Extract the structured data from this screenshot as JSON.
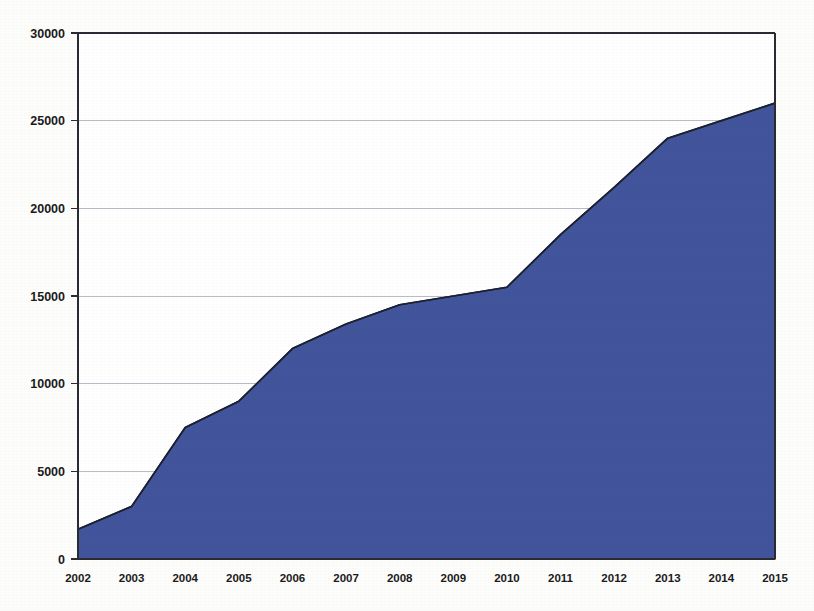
{
  "chart_data": {
    "type": "area",
    "title": "",
    "subtitle": "",
    "xlabel": "",
    "ylabel": "",
    "categories": [
      "2002",
      "2003",
      "2004",
      "2005",
      "2006",
      "2007",
      "2008",
      "2009",
      "2010",
      "2011",
      "2012",
      "2013",
      "2014",
      "2015"
    ],
    "values": [
      1700,
      3000,
      7500,
      9000,
      12000,
      13400,
      14500,
      15000,
      15500,
      18500,
      21200,
      24000,
      25000,
      26000
    ],
    "series": [
      {
        "name": "series-1",
        "values": [
          1700,
          3000,
          7500,
          9000,
          12000,
          13400,
          14500,
          15000,
          15500,
          18500,
          21200,
          24000,
          25000,
          26000
        ],
        "color": "#42559C"
      }
    ],
    "ylim": [
      0,
      30000
    ],
    "xlim": [
      "2002",
      "2015"
    ],
    "yticks": [
      0,
      5000,
      10000,
      15000,
      20000,
      25000,
      30000
    ],
    "ytick_labels": [
      "0",
      "5000",
      "10000",
      "15000",
      "20000",
      "25000",
      "30000"
    ],
    "xtick_labels": [
      "2002",
      "2003",
      "2004",
      "2005",
      "2006",
      "2007",
      "2008",
      "2009",
      "2010",
      "2011",
      "2012",
      "2013",
      "2014",
      "2015"
    ],
    "grid": true,
    "grid_axis": "y",
    "legend": false,
    "legend_position": "none",
    "annotations": []
  },
  "style": {
    "area_fill": "#42559C",
    "area_stroke": "#1d2230",
    "grid_color": "#b9bcc6",
    "axis_color": "#2b2c33",
    "background": "#fdfdfc",
    "plot_background": "#ffffff",
    "tick_label_color": "#1b1b1b"
  },
  "geometry": {
    "plot_left": 78,
    "plot_right": 775,
    "plot_top": 33,
    "plot_bottom": 559
  }
}
